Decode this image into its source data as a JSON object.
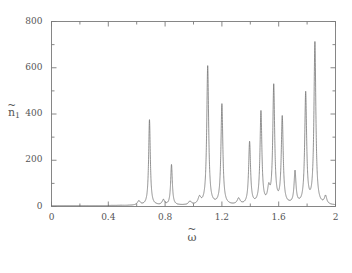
{
  "chart_data": {
    "type": "line",
    "title": "",
    "subtitle": "",
    "xlabel": "ω̃",
    "ylabel": "ñ₁",
    "xlabel_base": "ω",
    "ylabel_base": "n",
    "ylabel_subscript": "1",
    "xlim": [
      0,
      2
    ],
    "ylim": [
      0,
      800
    ],
    "xticks": [
      0,
      0.4,
      0.8,
      1.2,
      1.6,
      2
    ],
    "xtick_labels": [
      "0",
      "0.4",
      "0.8",
      "1.2",
      "1.6",
      "2"
    ],
    "yticks": [
      0,
      200,
      400,
      600,
      800
    ],
    "ytick_labels": [
      "0",
      "200",
      "400",
      "600",
      "800"
    ],
    "x_minor_ticks": [
      0.2,
      0.6,
      1.0,
      1.4,
      1.8
    ],
    "y_minor_ticks": [
      100,
      300,
      500,
      700
    ],
    "grid": false,
    "legend": null,
    "line_color": "#6f6f6f",
    "frame_color": "#7a7a7a",
    "background_color": "#ffffff",
    "series": [
      {
        "name": "n1-spectrum",
        "description": "Resonance spectrum: sharp Lorentzian peaks on a near-zero baseline",
        "baseline": 4,
        "peaks": [
          {
            "x": 0.615,
            "height": 18,
            "width": 0.012
          },
          {
            "x": 0.69,
            "height": 370,
            "width": 0.007
          },
          {
            "x": 0.788,
            "height": 22,
            "width": 0.01
          },
          {
            "x": 0.845,
            "height": 175,
            "width": 0.007
          },
          {
            "x": 0.975,
            "height": 15,
            "width": 0.012
          },
          {
            "x": 1.042,
            "height": 30,
            "width": 0.012
          },
          {
            "x": 1.1,
            "height": 600,
            "width": 0.008
          },
          {
            "x": 1.2,
            "height": 435,
            "width": 0.008
          },
          {
            "x": 1.318,
            "height": 26,
            "width": 0.012
          },
          {
            "x": 1.395,
            "height": 270,
            "width": 0.008
          },
          {
            "x": 1.475,
            "height": 400,
            "width": 0.008
          },
          {
            "x": 1.53,
            "height": 60,
            "width": 0.01
          },
          {
            "x": 1.565,
            "height": 510,
            "width": 0.008
          },
          {
            "x": 1.625,
            "height": 375,
            "width": 0.008
          },
          {
            "x": 1.715,
            "height": 140,
            "width": 0.008
          },
          {
            "x": 1.79,
            "height": 480,
            "width": 0.008
          },
          {
            "x": 1.855,
            "height": 700,
            "width": 0.008
          },
          {
            "x": 1.93,
            "height": 35,
            "width": 0.01
          }
        ]
      }
    ]
  }
}
